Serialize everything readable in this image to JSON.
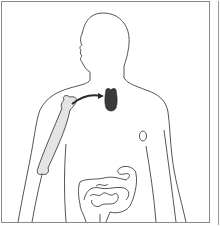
{
  "diagram": {
    "type": "anatomical-illustration",
    "elements": [
      {
        "name": "body-outline",
        "style": "outline"
      },
      {
        "name": "humerus-bone",
        "fill": "#e4e4e4"
      },
      {
        "name": "thymus",
        "fill": "#3a3a3a"
      },
      {
        "name": "arrow-bone-to-thymus",
        "from": "humerus-bone",
        "to": "thymus"
      },
      {
        "name": "spleen-node",
        "style": "outline"
      },
      {
        "name": "intestines",
        "style": "outline"
      }
    ],
    "colors": {
      "outline": "#2a2a2a",
      "bone": "#e4e4e4",
      "organ": "#3a3a3a",
      "frame": "#8a8a8a",
      "background": "#ffffff"
    }
  }
}
